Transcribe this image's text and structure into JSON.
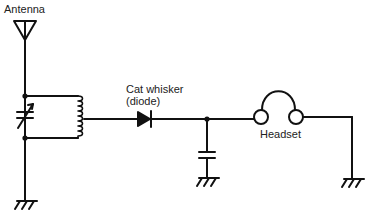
{
  "diagram": {
    "type": "crystal radio circuit schematic",
    "labels": {
      "antenna": "Antenna",
      "diode_line1": "Cat whisker",
      "diode_line2": "(diode)",
      "headset": "Headset"
    },
    "components": [
      {
        "name": "antenna",
        "label": "Antenna"
      },
      {
        "name": "variable-capacitor",
        "label": ""
      },
      {
        "name": "inductor-coil",
        "label": ""
      },
      {
        "name": "diode",
        "label": "Cat whisker (diode)"
      },
      {
        "name": "capacitor",
        "label": ""
      },
      {
        "name": "headset",
        "label": "Headset"
      },
      {
        "name": "ground",
        "count": 3
      }
    ],
    "colors": {
      "line": "#111111",
      "background": "#ffffff"
    }
  }
}
